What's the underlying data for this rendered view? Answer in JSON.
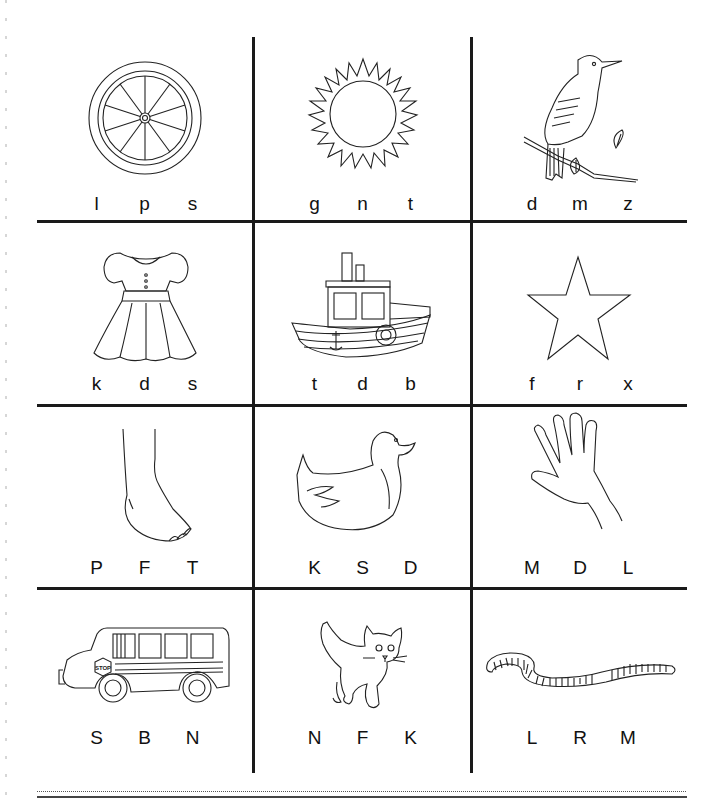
{
  "worksheet": {
    "cells": [
      {
        "picture": "wagon-wheel",
        "letters": [
          "l",
          "p",
          "s"
        ]
      },
      {
        "picture": "sun",
        "letters": [
          "g",
          "n",
          "t"
        ]
      },
      {
        "picture": "bird",
        "letters": [
          "d",
          "m",
          "z"
        ]
      },
      {
        "picture": "dress",
        "letters": [
          "k",
          "d",
          "s"
        ]
      },
      {
        "picture": "boat",
        "letters": [
          "t",
          "d",
          "b"
        ]
      },
      {
        "picture": "star",
        "letters": [
          "f",
          "r",
          "x"
        ]
      },
      {
        "picture": "foot",
        "letters": [
          "P",
          "F",
          "T"
        ]
      },
      {
        "picture": "duck",
        "letters": [
          "K",
          "S",
          "D"
        ]
      },
      {
        "picture": "hand",
        "letters": [
          "M",
          "D",
          "L"
        ]
      },
      {
        "picture": "school-bus",
        "letters": [
          "S",
          "B",
          "N"
        ]
      },
      {
        "picture": "kitten",
        "letters": [
          "N",
          "F",
          "K"
        ]
      },
      {
        "picture": "worm",
        "letters": [
          "L",
          "R",
          "M"
        ]
      }
    ],
    "bus_sign_text": "STOP"
  }
}
